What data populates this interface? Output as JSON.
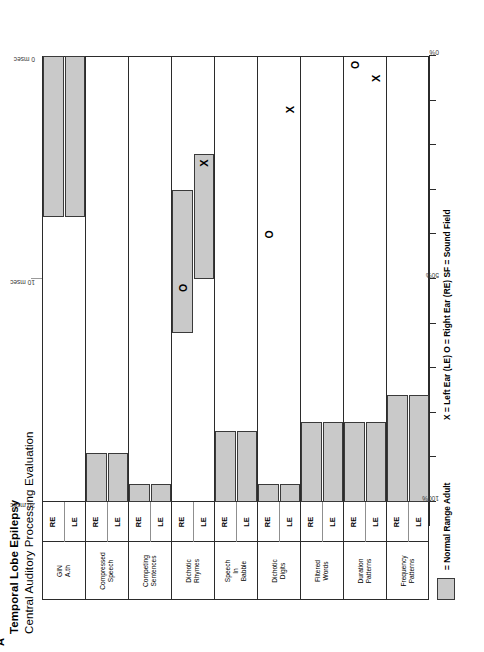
{
  "figure": {
    "panel_label": "A",
    "title": "Temporal Lobe Epilepsy",
    "subtitle": "Central Auditory Processing Evaluation"
  },
  "legend": {
    "swatch_label": "= Normal Range Adult",
    "key_line": "X = Left Ear (LE)   O = Right Ear (RE)    SF = Sound Field",
    "swatch_color": "#c9c9c9",
    "swatch_border": "#3a3a3a"
  },
  "axes": {
    "bottom": {
      "label_left": "100%",
      "label_mid": "50%",
      "label_right": "0%",
      "ticks": [
        "100%",
        "",
        "",
        "",
        "",
        "50%",
        "",
        "",
        "",
        "",
        "0%"
      ]
    },
    "top": {
      "label_left": "20 msec",
      "label_mid": "10 msec",
      "label_right": "0 msec"
    }
  },
  "columns": {
    "ear_left": "LE",
    "ear_right": "RE"
  },
  "chart_data": {
    "type": "bar",
    "title": "Temporal Lobe Epilepsy",
    "subtitle": "Central Auditory Processing Evaluation",
    "xlabel": "Percent Correct",
    "ylabel": "Test",
    "xlim": [
      100,
      0
    ],
    "x_tick_labels": [
      "100%",
      "50%",
      "0%"
    ],
    "x_tick_values": [
      100,
      50,
      0
    ],
    "secondary_axis": {
      "name": "GIN approximate threshold",
      "unit": "msec",
      "xlim": [
        20,
        0
      ],
      "tick_labels": [
        "20 msec",
        "10 msec",
        "0 msec"
      ],
      "tick_values": [
        20,
        10,
        0
      ]
    },
    "grid": false,
    "legend_position": "below",
    "series_note": "Shaded bar = normal range for adults; X = Left Ear result; O = Right Ear result",
    "rows": [
      {
        "test": "GIN\nA.th",
        "test_line1": "GIN",
        "test_line2": "A.th",
        "uses_msec_axis": true,
        "ears": [
          {
            "ear": "RE",
            "normal_range": [
              36,
              0
            ],
            "normal_range_msec": [
              7.2,
              0
            ],
            "marker": null,
            "marker_value": null
          },
          {
            "ear": "LE",
            "normal_range": [
              36,
              0
            ],
            "normal_range_msec": [
              7.2,
              0
            ],
            "marker": null,
            "marker_value": null
          }
        ]
      },
      {
        "test": "Compressed Speech",
        "test_line1": "Compressed",
        "test_line2": "Speech",
        "uses_msec_axis": false,
        "ears": [
          {
            "ear": "RE",
            "normal_range": [
              100,
              89
            ],
            "marker": null,
            "marker_value": null
          },
          {
            "ear": "LE",
            "normal_range": [
              100,
              89
            ],
            "marker": null,
            "marker_value": null
          }
        ]
      },
      {
        "test": "Competing Sentences",
        "test_line1": "Competing",
        "test_line2": "Sentences",
        "uses_msec_axis": false,
        "ears": [
          {
            "ear": "RE",
            "normal_range": [
              100,
              96
            ],
            "marker": null,
            "marker_value": null
          },
          {
            "ear": "LE",
            "normal_range": [
              100,
              96
            ],
            "marker": null,
            "marker_value": null
          }
        ]
      },
      {
        "test": "Dichotic Rhymes",
        "test_line1": "Dichotic",
        "test_line2": "Rhymes",
        "uses_msec_axis": false,
        "ears": [
          {
            "ear": "RE",
            "normal_range": [
              62,
              30
            ],
            "marker": "O",
            "marker_value": 52
          },
          {
            "ear": "LE",
            "normal_range": [
              50,
              22
            ],
            "marker": "X",
            "marker_value": 24
          }
        ]
      },
      {
        "test": "Speech In Babble",
        "test_line1": "Speech",
        "test_line2": "In",
        "test_line3": "Babble",
        "uses_msec_axis": false,
        "ears": [
          {
            "ear": "RE",
            "normal_range": [
              100,
              84
            ],
            "marker": null,
            "marker_value": null
          },
          {
            "ear": "LE",
            "normal_range": [
              100,
              84
            ],
            "marker": null,
            "marker_value": null
          }
        ]
      },
      {
        "test": "Dichotic Digits",
        "test_line1": "Dichotic",
        "test_line2": "Digits",
        "uses_msec_axis": false,
        "ears": [
          {
            "ear": "RE",
            "normal_range": [
              100,
              96
            ],
            "marker": "O",
            "marker_value": 40
          },
          {
            "ear": "LE",
            "normal_range": [
              100,
              96
            ],
            "marker": "X",
            "marker_value": 12
          }
        ]
      },
      {
        "test": "Filtered Words",
        "test_line1": "Filtered",
        "test_line2": "Words",
        "uses_msec_axis": false,
        "ears": [
          {
            "ear": "RE",
            "normal_range": [
              100,
              82
            ],
            "marker": null,
            "marker_value": null
          },
          {
            "ear": "LE",
            "normal_range": [
              100,
              82
            ],
            "marker": null,
            "marker_value": null
          }
        ]
      },
      {
        "test": "Duration Patterns",
        "test_line1": "Duration",
        "test_line2": "Patterns",
        "uses_msec_axis": false,
        "ears": [
          {
            "ear": "RE",
            "normal_range": [
              100,
              82
            ],
            "marker": "O",
            "marker_value": 2
          },
          {
            "ear": "LE",
            "normal_range": [
              100,
              82
            ],
            "marker": "X",
            "marker_value": 5
          }
        ]
      },
      {
        "test": "Frequency Patterns",
        "test_line1": "Frequency",
        "test_line2": "Patterns",
        "uses_msec_axis": false,
        "ears": [
          {
            "ear": "RE",
            "normal_range": [
              100,
              76
            ],
            "marker": null,
            "marker_value": null
          },
          {
            "ear": "LE",
            "normal_range": [
              100,
              76
            ],
            "marker": null,
            "marker_value": null
          }
        ]
      }
    ]
  }
}
